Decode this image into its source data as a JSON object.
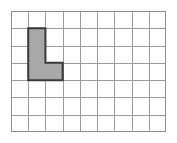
{
  "figure": {
    "title": "Shaded L-shape on a square grid",
    "description": "A rectangular grid of unit squares with one contiguous L-shaped region shaded gray and outlined in dark gray.",
    "background_color": "#ffffff"
  },
  "grid": {
    "columns": 9,
    "rows": 7,
    "cell_size_px": 17.2,
    "origin_x_px": 11,
    "origin_y_px": 11,
    "width_px": 155,
    "height_px": 121,
    "line_color": "#9a9a9a",
    "border_color": "#8e8e8e",
    "line_width_px": 1,
    "show_labels": false
  },
  "shape": {
    "name": "l-shape",
    "label": "L",
    "fill_color": "#a8a8a8",
    "outline_color": "#3a3a3a",
    "outline_width_px": 2,
    "area_cells": 4,
    "perimeter_units": 10,
    "cells": [
      {
        "col": 2,
        "row": 2
      },
      {
        "col": 2,
        "row": 3
      },
      {
        "col": 2,
        "row": 4
      },
      {
        "col": 3,
        "row": 4
      }
    ],
    "outline_points_cells": [
      {
        "x": 1,
        "y": 1
      },
      {
        "x": 2,
        "y": 1
      },
      {
        "x": 2,
        "y": 3
      },
      {
        "x": 3,
        "y": 3
      },
      {
        "x": 3,
        "y": 4
      },
      {
        "x": 1,
        "y": 4
      }
    ]
  }
}
